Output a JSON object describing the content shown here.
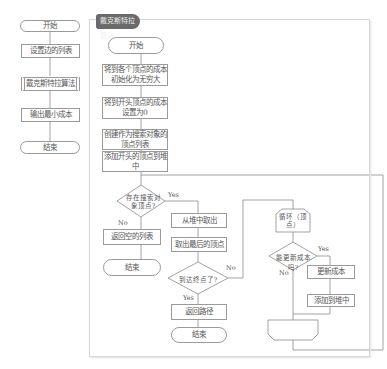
{
  "main_flow": {
    "start": "开始",
    "set_edges": "设置边的列表",
    "dijkstra": "戴克斯特拉算法",
    "output": "输出最小成本",
    "end": "结束"
  },
  "panel": {
    "title": "戴克斯特拉算法",
    "start": "开始",
    "init_cost": "将到各个顶点的成本初始化为无穷大",
    "set_start_cost": "将到开头顶点的成本设置为0",
    "create_list": "创建作为搜索对象的顶点列表",
    "add_start": "添加开头的顶点到堆中",
    "has_target": "存在搜索对象顶点?",
    "return_empty": "返回空的列表",
    "end_left": "结束",
    "pop_heap": "从堆中取出",
    "take_last": "取出最后的顶点",
    "reached": "到达终点了?",
    "return_path": "返回路径",
    "end_bottom": "结束",
    "loop_start": "循环（顶点）",
    "can_update": "能更新成本吗?",
    "update_cost": "更新成本",
    "add_heap": "添加到堆中",
    "labels": {
      "yes": "Yes",
      "no": "No"
    }
  }
}
